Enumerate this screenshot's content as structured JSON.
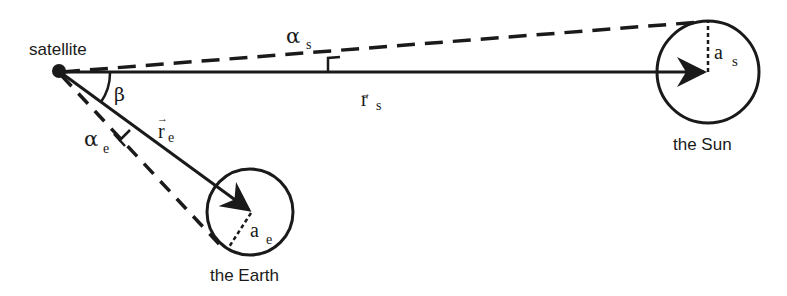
{
  "diagram": {
    "labels": {
      "satellite": "satellite",
      "sun": "the Sun",
      "earth": "the Earth",
      "beta": "β",
      "alpha": "α",
      "alpha_s_sub": "s",
      "alpha_e_sub": "e",
      "r": "r",
      "r_s_sub": "s",
      "r_e_sub": "e",
      "a": "a",
      "a_s_sub": "s",
      "a_e_sub": "e",
      "vec_arrow": "→"
    },
    "colors": {
      "stroke": "#1a1a1a",
      "background": "#ffffff"
    }
  }
}
